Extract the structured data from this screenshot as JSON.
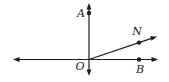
{
  "diagram": {
    "width": 169,
    "height": 82,
    "background": "#ffffff",
    "stroke": "#1c1c1c",
    "stroke_width": 1.2,
    "dot_radius": 2.2,
    "arrow_length": 6.5,
    "arrow_half_width": 2.4,
    "label_font_size": 11,
    "segments": [
      {
        "name": "horizontal-line",
        "x1": 13,
        "y1": 59.5,
        "x2": 158,
        "y2": 59.5,
        "arrow_start": true,
        "arrow_end": true
      },
      {
        "name": "vertical-line",
        "x1": 89,
        "y1": 3,
        "x2": 89,
        "y2": 76,
        "arrow_start": true,
        "arrow_end": true
      },
      {
        "name": "ray-O-N",
        "x1": 89,
        "y1": 59.5,
        "x2": 157,
        "y2": 36.5,
        "arrow_start": false,
        "arrow_end": true
      }
    ],
    "points": [
      {
        "name": "point-A",
        "x": 89,
        "y": 13
      },
      {
        "name": "point-N",
        "x": 139,
        "y": 42.6
      },
      {
        "name": "point-B",
        "x": 139,
        "y": 59.5
      }
    ],
    "labels": [
      {
        "name": "label-A",
        "text": "A",
        "x": 85,
        "y": 17,
        "anchor": "end"
      },
      {
        "name": "label-N",
        "text": "N",
        "x": 137,
        "y": 35,
        "anchor": "middle"
      },
      {
        "name": "label-O",
        "text": "O",
        "x": 80,
        "y": 70,
        "anchor": "middle"
      },
      {
        "name": "label-B",
        "text": "B",
        "x": 140,
        "y": 73,
        "anchor": "middle"
      }
    ]
  }
}
